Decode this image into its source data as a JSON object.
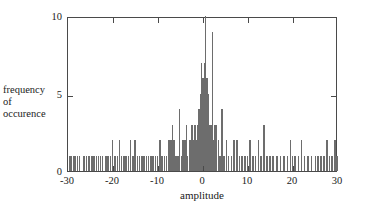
{
  "chart_data": {
    "type": "bar",
    "title": "",
    "subtitle": "",
    "xlabel": "amplitude",
    "ylabel": "frequency of occurence",
    "ylabel_lines": [
      "frequency",
      "of",
      "occurence"
    ],
    "xlim": [
      -30,
      30
    ],
    "ylim": [
      0,
      10
    ],
    "xticks": [
      -30,
      -20,
      -10,
      0,
      10,
      20,
      30
    ],
    "xtick_labels": [
      "-30",
      "-20",
      "-10",
      "0",
      "10",
      "20",
      "30"
    ],
    "yticks": [
      0,
      5,
      10
    ],
    "ytick_labels": [
      "0",
      "5",
      "10"
    ],
    "grid": false,
    "legend": null,
    "bar_color": "#6d6d6d",
    "axis_color": "#4a4a4a",
    "bin_width": 0.35,
    "x": [
      -29.6,
      -29.2,
      -28.8,
      -28.4,
      -27.9,
      -27.4,
      -26.4,
      -25.9,
      -25.3,
      -24.7,
      -24.2,
      -23.7,
      -23.2,
      -22.8,
      -22.3,
      -21.6,
      -21.1,
      -20.6,
      -20.1,
      -19.5,
      -19.0,
      -18.6,
      -18.1,
      -17.6,
      -17.1,
      -16.6,
      -16.1,
      -15.6,
      -15.1,
      -14.6,
      -14.1,
      -13.6,
      -13.1,
      -12.6,
      -12.1,
      -11.6,
      -11.1,
      -10.6,
      -10.1,
      -9.6,
      -9.1,
      -8.6,
      -8.1,
      -7.6,
      -7.1,
      -6.8,
      -6.4,
      -6.0,
      -5.6,
      -5.2,
      -4.8,
      -4.4,
      -4.0,
      -3.7,
      -3.4,
      -3.0,
      -2.7,
      -2.4,
      -2.1,
      -1.8,
      -1.5,
      -1.2,
      -0.9,
      -0.6,
      -0.3,
      0.0,
      0.3,
      0.6,
      0.9,
      1.2,
      1.5,
      1.8,
      2.1,
      2.4,
      2.7,
      3.0,
      3.4,
      3.8,
      4.2,
      4.7,
      5.2,
      5.7,
      6.3,
      6.9,
      7.5,
      8.1,
      8.7,
      9.3,
      9.9,
      10.5,
      11.1,
      11.7,
      12.3,
      12.9,
      13.5,
      14.2,
      14.9,
      15.6,
      16.4,
      17.2,
      18.0,
      18.8,
      19.4,
      19.9,
      20.5,
      21.2,
      21.9,
      22.6,
      23.3,
      24.1,
      25.0,
      25.6,
      26.2,
      26.9,
      27.5,
      28.1,
      28.7,
      29.3,
      29.8
    ],
    "values": [
      1,
      1,
      1,
      1,
      1,
      1,
      1,
      1,
      1,
      1,
      1,
      1,
      1,
      1,
      1,
      1,
      1,
      1,
      2,
      1,
      1,
      2,
      1,
      1,
      1,
      1,
      2,
      1,
      2,
      1,
      1,
      1,
      1,
      1,
      1,
      1,
      1,
      1,
      1,
      2,
      1,
      1,
      1,
      2,
      2,
      3,
      2,
      1,
      1,
      4,
      1,
      2,
      2,
      3,
      1,
      2,
      2,
      3,
      2,
      3,
      2,
      3,
      4,
      5,
      7,
      6,
      7,
      10,
      6,
      5,
      3,
      3,
      9,
      2,
      3,
      3,
      2,
      1,
      4,
      1,
      2,
      1,
      1,
      2,
      2,
      1,
      1,
      1,
      1,
      2,
      1,
      1,
      2,
      1,
      3,
      1,
      1,
      1,
      1,
      1,
      1,
      1,
      2,
      1,
      1,
      1,
      2,
      1,
      1,
      1,
      1,
      1,
      1,
      1,
      2,
      1,
      1,
      2,
      1
    ]
  }
}
